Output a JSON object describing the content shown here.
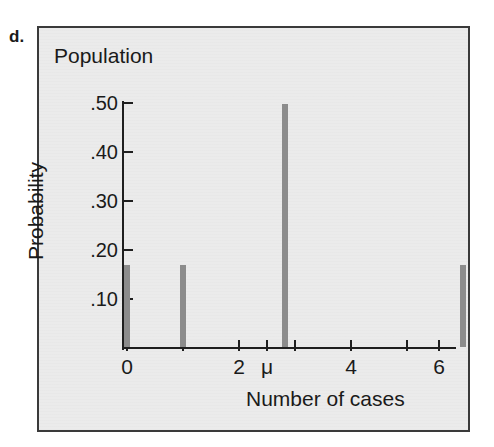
{
  "figure": {
    "item_label": "d.",
    "panel_title": "Population"
  },
  "chart_data": {
    "type": "bar",
    "title": "Population",
    "xlabel": "Number of cases",
    "ylabel": "Probability",
    "xlim": [
      -0.22,
      6.0
    ],
    "ylim": [
      0.0,
      0.53
    ],
    "grid": false,
    "legend": null,
    "x": [
      0,
      1,
      2.83,
      6
    ],
    "values": [
      0.167,
      0.168,
      0.495,
      0.167
    ],
    "categories": [
      "0",
      "1",
      "2.83",
      "6"
    ],
    "bar_color": "#8c8c8c",
    "y_ticks": [
      0.5,
      0.4,
      0.3,
      0.2,
      0.1
    ],
    "y_tick_labels": [
      ".50",
      ".40",
      ".30",
      ".20",
      ".10"
    ],
    "x_ticks": [
      0,
      1,
      2,
      2.5,
      3,
      4,
      5,
      6
    ],
    "x_tick_labels": [
      "0",
      "",
      "2",
      "μ",
      "",
      "4",
      "",
      "6"
    ],
    "annotations": [
      {
        "text": "μ",
        "x": 2.5,
        "note": "population mean marker on x axis"
      }
    ]
  },
  "axes": {
    "y_labels": [
      ".50",
      ".40",
      ".30",
      ".20",
      ".10"
    ],
    "x_labels": [
      "0",
      "2",
      "μ",
      "4",
      "6"
    ],
    "y_title": "Probability",
    "x_title": "Number of cases"
  },
  "colors": {
    "panel_background": "#ebebeb",
    "panel_border": "#3a3a3a",
    "bar": "#8c8c8c",
    "axis": "#1f1f1f",
    "text": "#1a1a1a"
  }
}
